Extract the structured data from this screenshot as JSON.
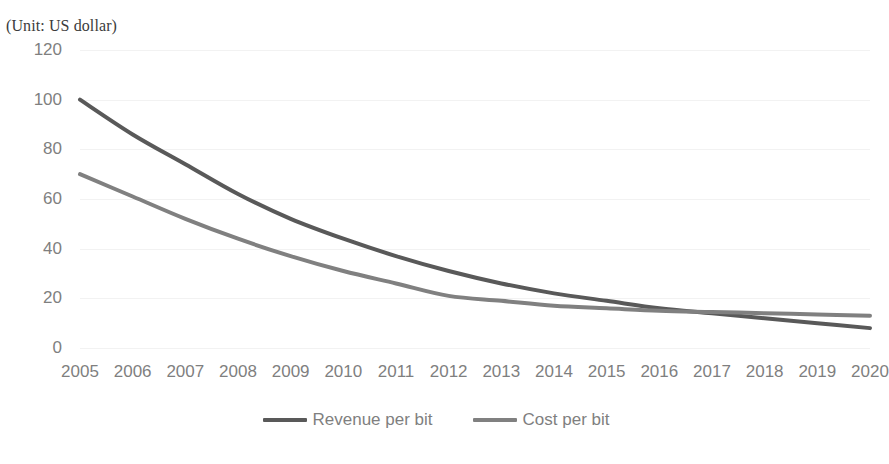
{
  "unit_label": "(Unit: US dollar)",
  "colors": {
    "revenue": "#595959",
    "cost": "#808080",
    "gridline": "#f2f2f2",
    "tick_text": "#7f7f7f",
    "unit_text": "#3b3b3b",
    "background": "#ffffff"
  },
  "legend": {
    "position": "bottom",
    "items": [
      {
        "label": "Revenue per bit",
        "color": "#595959"
      },
      {
        "label": "Cost per bit",
        "color": "#808080"
      }
    ]
  },
  "axes": {
    "y_ticks": [
      "0",
      "20",
      "40",
      "60",
      "80",
      "100",
      "120"
    ],
    "x_ticks": [
      "2005",
      "2006",
      "2007",
      "2008",
      "2009",
      "2010",
      "2011",
      "2012",
      "2013",
      "2014",
      "2015",
      "2016",
      "2017",
      "2018",
      "2019",
      "2020"
    ]
  },
  "chart_data": {
    "type": "line",
    "title": "",
    "subtitle": "(Unit: US dollar)",
    "xlabel": "",
    "ylabel": "",
    "unit": "US dollar",
    "categories": [
      "2005",
      "2006",
      "2007",
      "2008",
      "2009",
      "2010",
      "2011",
      "2012",
      "2013",
      "2014",
      "2015",
      "2016",
      "2017",
      "2018",
      "2019",
      "2020"
    ],
    "x": [
      2005,
      2006,
      2007,
      2008,
      2009,
      2010,
      2011,
      2012,
      2013,
      2014,
      2015,
      2016,
      2017,
      2018,
      2019,
      2020
    ],
    "series": [
      {
        "name": "Revenue per bit",
        "color": "#595959",
        "values": [
          100,
          86,
          74,
          62,
          52,
          44,
          37,
          31,
          26,
          22,
          19,
          16,
          14,
          12,
          10,
          8
        ]
      },
      {
        "name": "Cost per bit",
        "color": "#808080",
        "values": [
          70,
          61,
          52,
          44,
          37,
          31,
          26,
          21,
          19,
          17,
          16,
          15,
          14.5,
          14,
          13.5,
          13
        ]
      }
    ],
    "ylim": [
      0,
      120
    ],
    "ytick_step": 20,
    "grid": true,
    "grid_axis": "y",
    "legend_position": "bottom",
    "markers": false,
    "smooth": true
  }
}
